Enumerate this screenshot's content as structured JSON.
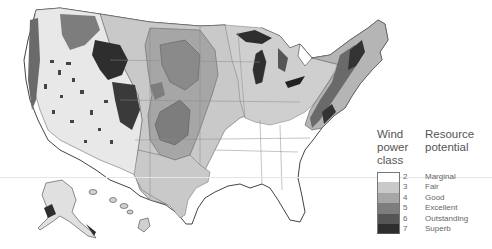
{
  "legend": {
    "title_left": "Wind power class",
    "title_left_lines": [
      "Wind",
      "power",
      "class"
    ],
    "title_right": "Resource potential",
    "title_right_lines": [
      "Resource",
      "potential"
    ],
    "items": [
      {
        "class": "2",
        "label": "Marginal",
        "color": "#ffffff"
      },
      {
        "class": "3",
        "label": "Fair",
        "color": "#c9c9c9"
      },
      {
        "class": "4",
        "label": "Good",
        "color": "#a6a6a6"
      },
      {
        "class": "5",
        "label": "Excellent",
        "color": "#7d7d7d"
      },
      {
        "class": "6",
        "label": "Outstanding",
        "color": "#555555"
      },
      {
        "class": "7",
        "label": "Superb",
        "color": "#2e2e2e"
      }
    ]
  },
  "colors": {
    "class2": "#ffffff",
    "class3": "#c9c9c9",
    "class4": "#a6a6a6",
    "class5": "#7d7d7d",
    "class6": "#555555",
    "class7": "#2e2e2e",
    "border": "#555555",
    "state_lines": "#8a8a8a"
  }
}
